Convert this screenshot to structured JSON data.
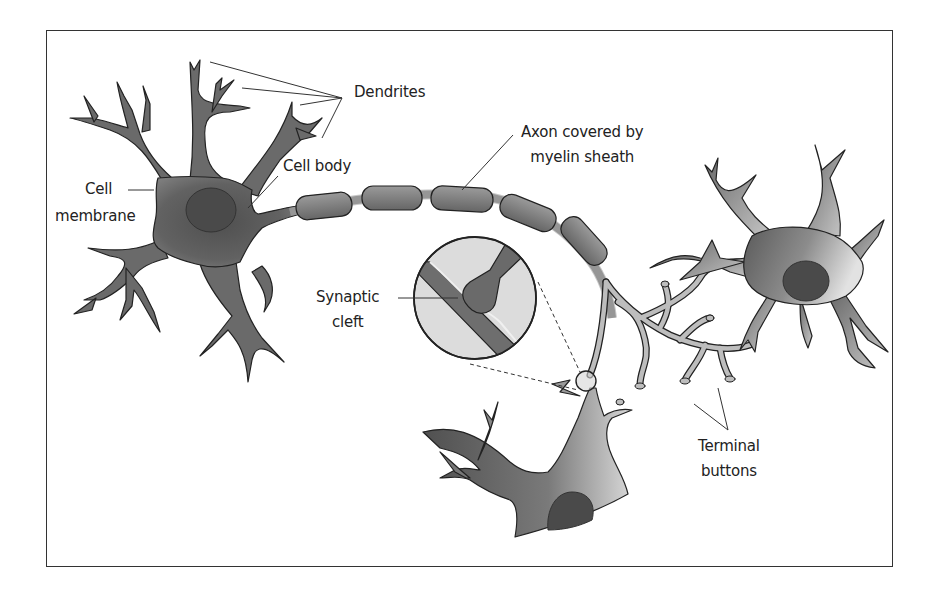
{
  "diagram": {
    "type": "neuron-anatomy",
    "colors": {
      "cell_dark": "#5a5a5a",
      "cell_light": "#d6d6d6",
      "nucleus": "#4a4a4a",
      "myelin": "#7b7b7b",
      "inset_bg": "#dcdcdc",
      "outline": "#222222",
      "frame": "#333333"
    },
    "labels": {
      "dendrites": "Dendrites",
      "cell_body": "Cell body",
      "cell_membrane_line1": "Cell",
      "cell_membrane_line2": "membrane",
      "axon_line1": "Axon covered by",
      "axon_line2": "myelin sheath",
      "synaptic_line1": "Synaptic",
      "synaptic_line2": "cleft",
      "terminal_line1": "Terminal",
      "terminal_line2": "buttons"
    },
    "parts": [
      "Dendrites",
      "Cell body",
      "Cell membrane",
      "Axon covered by myelin sheath",
      "Synaptic cleft",
      "Terminal buttons"
    ]
  }
}
